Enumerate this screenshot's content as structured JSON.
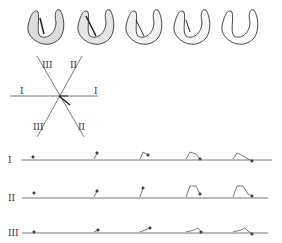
{
  "figure": {
    "hearts": [
      {
        "x": 42,
        "stage": 1
      },
      {
        "x": 92,
        "stage": 2
      },
      {
        "x": 140,
        "stage": 3
      },
      {
        "x": 188,
        "stage": 4
      },
      {
        "x": 236,
        "stage": 5
      }
    ],
    "axes": {
      "lead_I_left": "I",
      "lead_I_right": "I",
      "lead_II_top": "II",
      "lead_II_bottom": "II",
      "lead_III_top": "III",
      "lead_III_bottom": "III"
    },
    "leads": [
      {
        "label": "I",
        "y": 160
      },
      {
        "label": "II",
        "y": 198
      },
      {
        "label": "III",
        "y": 233
      }
    ]
  }
}
